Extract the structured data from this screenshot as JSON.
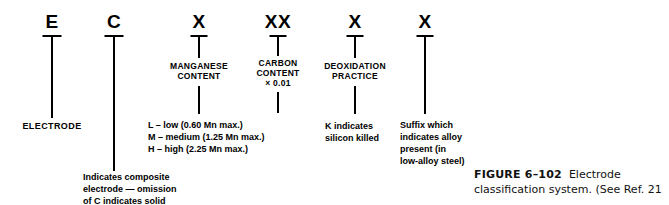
{
  "figure": {
    "number": "FIGURE 6–102",
    "caption": "Electrode classification system. (See Ref. 21"
  },
  "diagram": {
    "title": "Electrode classification system",
    "columns": [
      {
        "id": "electrode",
        "symbol": "E",
        "mid_label": "",
        "bottom_label": "ELECTRODE",
        "detail_lines": []
      },
      {
        "id": "composite",
        "symbol": "C",
        "mid_label": "",
        "bottom_label": "",
        "detail_lines": [
          "Indicates composite",
          "electrode — omission",
          "of C indicates solid"
        ]
      },
      {
        "id": "manganese-content",
        "symbol": "X",
        "mid_label_lines": [
          "MANGANESE",
          "CONTENT"
        ],
        "detail_lines": [
          "L – low (0.60 Mn max.)",
          "M – medium (1.25 Mn max.)",
          "H – high (2.25 Mn max.)"
        ]
      },
      {
        "id": "carbon-content",
        "symbol": "XX",
        "mid_label_lines": [
          "CARBON",
          "CONTENT",
          "× 0.01"
        ],
        "detail_lines": []
      },
      {
        "id": "deoxidation-practice",
        "symbol": "X",
        "mid_label_lines": [
          "DEOXIDATION",
          "PRACTICE"
        ],
        "detail_lines": [
          "K indicates",
          "silicon killed"
        ]
      },
      {
        "id": "alloy-suffix",
        "symbol": "X",
        "mid_label_lines": [],
        "detail_lines": [
          "Suffix which",
          "indicates alloy",
          "present (in",
          "low-alloy steel)"
        ]
      }
    ]
  },
  "colors": {
    "ink": "#000000",
    "background": "#ffffff"
  }
}
